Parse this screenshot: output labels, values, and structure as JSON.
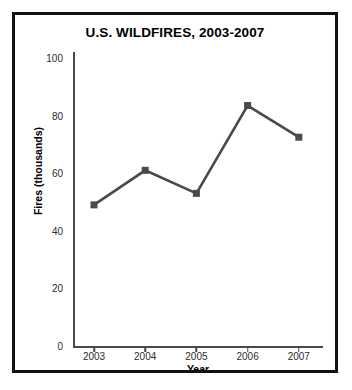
{
  "chart_data": {
    "type": "line",
    "title": "U.S. WILDFIRES, 2003-2007",
    "xlabel": "Year",
    "ylabel": "Fires (thousands)",
    "categories": [
      "2003",
      "2004",
      "2005",
      "2006",
      "2007"
    ],
    "values": [
      49,
      61,
      53,
      83.5,
      72.5
    ],
    "series": [
      {
        "name": "Fires (thousands)",
        "values": [
          49,
          61,
          53,
          83.5,
          72.5
        ]
      }
    ],
    "ylim": [
      0,
      100
    ],
    "yticks": [
      0,
      20,
      40,
      60,
      80,
      100
    ],
    "ytick_labels": [
      "0",
      "20",
      "40",
      "60",
      "80",
      "100"
    ],
    "xtick_labels": [
      "2003",
      "2004",
      "2005",
      "2006",
      "2007"
    ],
    "grid": false,
    "legend": false,
    "marker": "square",
    "line_color": "#4a4a4a",
    "marker_color": "#4a4a4a",
    "axis_color": "#4a4a4a",
    "frame_color": "#111111",
    "background": "#ffffff"
  }
}
